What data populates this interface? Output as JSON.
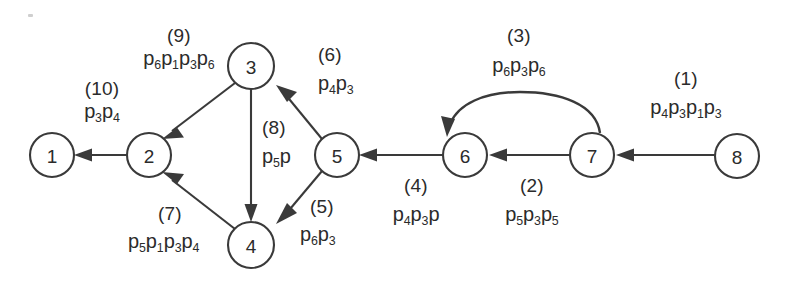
{
  "diagram": {
    "type": "directed-graph",
    "nodes": [
      {
        "id": "1",
        "label": "1",
        "cx": 52,
        "cy": 155,
        "r": 22
      },
      {
        "id": "2",
        "label": "2",
        "cx": 149,
        "cy": 155,
        "r": 22
      },
      {
        "id": "3",
        "label": "3",
        "cx": 251,
        "cy": 66,
        "r": 23
      },
      {
        "id": "4",
        "label": "4",
        "cx": 251,
        "cy": 245,
        "r": 23
      },
      {
        "id": "5",
        "label": "5",
        "cx": 337,
        "cy": 155,
        "r": 22
      },
      {
        "id": "6",
        "label": "6",
        "cx": 465,
        "cy": 155,
        "r": 22
      },
      {
        "id": "7",
        "label": "7",
        "cx": 592,
        "cy": 155,
        "r": 22
      },
      {
        "id": "8",
        "label": "8",
        "cx": 737,
        "cy": 156,
        "r": 22
      }
    ],
    "edges": [
      {
        "index": "(1)",
        "from": "8",
        "to": "7",
        "weight": "p4p3p1p3",
        "shape": "straight"
      },
      {
        "index": "(2)",
        "from": "7",
        "to": "6",
        "weight": "p5p3p5",
        "shape": "straight"
      },
      {
        "index": "(3)",
        "from": "7",
        "to": "6",
        "weight": "p6p3p6",
        "shape": "arc"
      },
      {
        "index": "(4)",
        "from": "6",
        "to": "5",
        "weight": "p4p3p",
        "shape": "straight"
      },
      {
        "index": "(5)",
        "from": "5",
        "to": "4",
        "weight": "p6p3",
        "shape": "straight"
      },
      {
        "index": "(6)",
        "from": "5",
        "to": "3",
        "weight": "p4p3",
        "shape": "straight"
      },
      {
        "index": "(7)",
        "from": "4",
        "to": "2",
        "weight": "p5p1p3p4",
        "shape": "straight"
      },
      {
        "index": "(8)",
        "from": "3",
        "to": "4",
        "weight": "p5p",
        "shape": "straight"
      },
      {
        "index": "(9)",
        "from": "3",
        "to": "2",
        "weight": "p6p1p3p6",
        "shape": "straight"
      },
      {
        "index": "(10)",
        "from": "2",
        "to": "1",
        "weight": "p3p4",
        "shape": "straight"
      }
    ],
    "annotations": {
      "e1": {
        "index": "(1)",
        "w_p": [
          "p",
          "p",
          "p",
          "p"
        ],
        "w_s": [
          "4",
          "3",
          "1",
          "3"
        ]
      },
      "e2": {
        "index": "(2)",
        "w_p": [
          "p",
          "p",
          "p"
        ],
        "w_s": [
          "5",
          "3",
          "5"
        ]
      },
      "e3": {
        "index": "(3)",
        "w_p": [
          "p",
          "p",
          "p"
        ],
        "w_s": [
          "6",
          "3",
          "6"
        ]
      },
      "e4": {
        "index": "(4)",
        "w_p": [
          "p",
          "p",
          "p"
        ],
        "w_s": [
          "4",
          "3",
          ""
        ]
      },
      "e5": {
        "index": "(5)",
        "w_p": [
          "p",
          "p"
        ],
        "w_s": [
          "6",
          "3"
        ]
      },
      "e6": {
        "index": "(6)",
        "w_p": [
          "p",
          "p"
        ],
        "w_s": [
          "4",
          "3"
        ]
      },
      "e7": {
        "index": "(7)",
        "w_p": [
          "p",
          "p",
          "p",
          "p"
        ],
        "w_s": [
          "5",
          "1",
          "3",
          "4"
        ]
      },
      "e8": {
        "index": "(8)",
        "w_p": [
          "p",
          "p"
        ],
        "w_s": [
          "5",
          ""
        ]
      },
      "e9": {
        "index": "(9)",
        "w_p": [
          "p",
          "p",
          "p",
          "p"
        ],
        "w_s": [
          "6",
          "1",
          "3",
          "6"
        ]
      },
      "e10": {
        "index": "(10)",
        "w_p": [
          "p",
          "p"
        ],
        "w_s": [
          "3",
          "4"
        ]
      }
    },
    "colors": {
      "stroke": "#3a3a3a",
      "text": "#2b2b2b",
      "background": "#ffffff"
    }
  }
}
